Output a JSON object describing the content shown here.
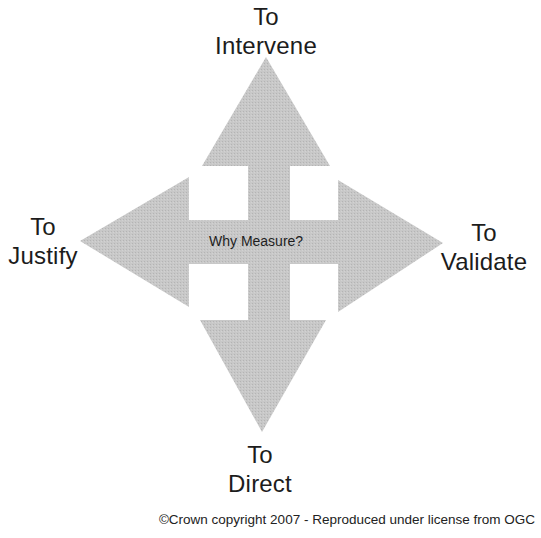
{
  "diagram": {
    "title": "Why Measure?",
    "arrows": [
      {
        "direction": "up",
        "label_line1": "To",
        "label_line2": "Intervene"
      },
      {
        "direction": "left",
        "label_line1": "To",
        "label_line2": "Justify"
      },
      {
        "direction": "right",
        "label_line1": "To",
        "label_line2": "Validate"
      },
      {
        "direction": "down",
        "label_line1": "To",
        "label_line2": "Direct"
      }
    ],
    "colors": {
      "arrow_fill": "#c4c4c4",
      "background": "#ffffff",
      "text": "#1c1c1c"
    }
  },
  "footer": {
    "credit": "©Crown copyright 2007 - Reproduced under license from OGC"
  }
}
